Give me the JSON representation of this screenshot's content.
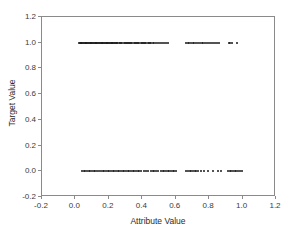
{
  "chart_data": {
    "type": "scatter",
    "title": "",
    "xlabel": "Attribute Value",
    "ylabel": "Target Value",
    "xlim": [
      -0.2,
      1.2
    ],
    "ylim": [
      -0.2,
      1.2
    ],
    "xticks": [
      "-0.2",
      "0.0",
      "0.2",
      "0.4",
      "0.6",
      "0.8",
      "1.0",
      "1.2"
    ],
    "xtick_values": [
      -0.2,
      0.0,
      0.2,
      0.4,
      0.6,
      0.8,
      1.0,
      1.2
    ],
    "yticks": [
      "-0.2",
      "0.0",
      "0.2",
      "0.4",
      "0.6",
      "0.8",
      "1.0",
      "1.2"
    ],
    "ytick_values": [
      -0.2,
      0.0,
      0.2,
      0.4,
      0.6,
      0.8,
      1.0,
      1.2
    ],
    "grid": false,
    "legend": false,
    "marker_color": "#1a1a1a",
    "marker_size": 2,
    "series": [
      {
        "name": "Target = 1",
        "y_value": 1.0,
        "x": [
          0.02,
          0.026,
          0.031,
          0.036,
          0.041,
          0.046,
          0.051,
          0.056,
          0.061,
          0.066,
          0.071,
          0.076,
          0.081,
          0.086,
          0.091,
          0.096,
          0.101,
          0.106,
          0.111,
          0.116,
          0.121,
          0.126,
          0.131,
          0.136,
          0.141,
          0.146,
          0.151,
          0.156,
          0.161,
          0.166,
          0.171,
          0.176,
          0.181,
          0.186,
          0.191,
          0.196,
          0.201,
          0.206,
          0.211,
          0.216,
          0.221,
          0.226,
          0.231,
          0.236,
          0.241,
          0.246,
          0.251,
          0.262,
          0.268,
          0.274,
          0.281,
          0.288,
          0.295,
          0.302,
          0.308,
          0.314,
          0.32,
          0.327,
          0.334,
          0.341,
          0.348,
          0.355,
          0.362,
          0.369,
          0.376,
          0.383,
          0.39,
          0.397,
          0.404,
          0.411,
          0.418,
          0.425,
          0.432,
          0.439,
          0.446,
          0.455,
          0.463,
          0.472,
          0.481,
          0.492,
          0.503,
          0.515,
          0.528,
          0.541,
          0.553,
          0.664,
          0.672,
          0.681,
          0.691,
          0.701,
          0.712,
          0.722,
          0.733,
          0.744,
          0.755,
          0.766,
          0.777,
          0.788,
          0.799,
          0.81,
          0.822,
          0.833,
          0.845,
          0.857,
          0.916,
          0.925,
          0.934,
          0.966
        ]
      },
      {
        "name": "Target = 0",
        "y_value": 0.0,
        "x": [
          0.04,
          0.05,
          0.06,
          0.07,
          0.08,
          0.09,
          0.1,
          0.11,
          0.12,
          0.132,
          0.142,
          0.152,
          0.162,
          0.172,
          0.182,
          0.192,
          0.202,
          0.212,
          0.222,
          0.232,
          0.242,
          0.252,
          0.262,
          0.272,
          0.282,
          0.292,
          0.302,
          0.312,
          0.322,
          0.332,
          0.342,
          0.352,
          0.362,
          0.372,
          0.382,
          0.392,
          0.412,
          0.424,
          0.436,
          0.452,
          0.462,
          0.472,
          0.484,
          0.496,
          0.512,
          0.522,
          0.532,
          0.542,
          0.552,
          0.562,
          0.572,
          0.582,
          0.592,
          0.602,
          0.664,
          0.674,
          0.684,
          0.694,
          0.704,
          0.714,
          0.724,
          0.734,
          0.752,
          0.772,
          0.792,
          0.822,
          0.852,
          0.872,
          0.912,
          0.922,
          0.932,
          0.942,
          0.952,
          0.962,
          0.972,
          0.982,
          0.996
        ]
      }
    ]
  }
}
